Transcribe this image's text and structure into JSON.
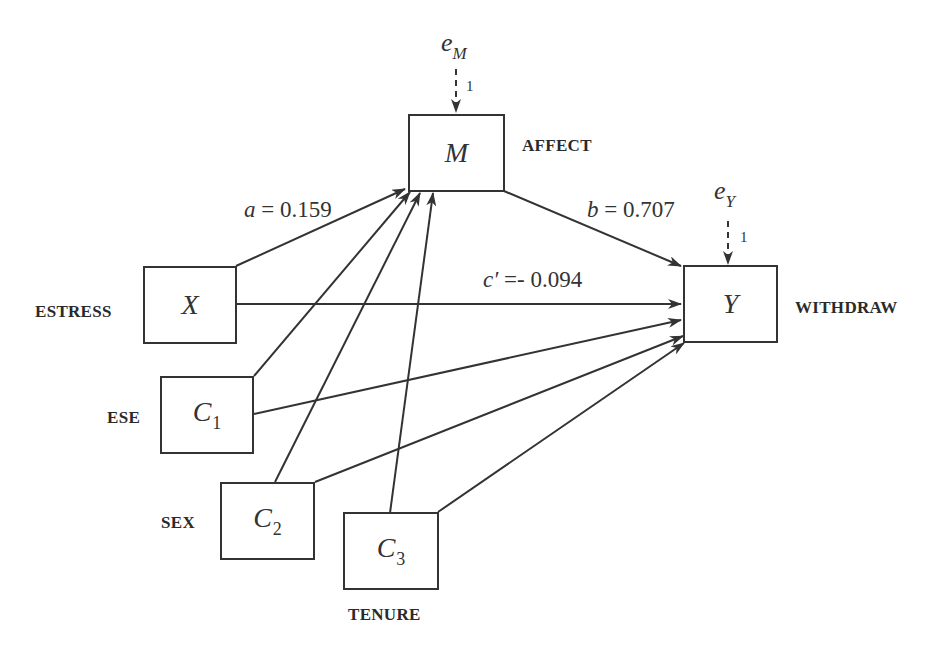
{
  "diagram": {
    "type": "mediation-path-diagram",
    "nodes": {
      "X": {
        "symbol": "X",
        "subscript": "",
        "name": "ESTRESS"
      },
      "M": {
        "symbol": "M",
        "subscript": "",
        "name": "AFFECT"
      },
      "Y": {
        "symbol": "Y",
        "subscript": "",
        "name": "WITHDRAW"
      },
      "C1": {
        "symbol": "C",
        "subscript": "1",
        "name": "ESE"
      },
      "C2": {
        "symbol": "C",
        "subscript": "2",
        "name": "SEX"
      },
      "C3": {
        "symbol": "C",
        "subscript": "3",
        "name": "TENURE"
      }
    },
    "errors": {
      "eM": {
        "symbol": "e",
        "subscript": "M",
        "weight": "1"
      },
      "eY": {
        "symbol": "e",
        "subscript": "Y",
        "weight": "1"
      }
    },
    "paths": {
      "a": {
        "label": "a",
        "equals": " = 0.159",
        "from": "X",
        "to": "M"
      },
      "b": {
        "label": "b",
        "equals": " = 0.707",
        "from": "M",
        "to": "Y"
      },
      "c_prime": {
        "label": "c′",
        "equals": " =- 0.094",
        "from": "X",
        "to": "Y"
      }
    },
    "unlabeled_paths": [
      {
        "from": "C1",
        "to": "M"
      },
      {
        "from": "C2",
        "to": "M"
      },
      {
        "from": "C3",
        "to": "M"
      },
      {
        "from": "C1",
        "to": "Y"
      },
      {
        "from": "C2",
        "to": "Y"
      },
      {
        "from": "C3",
        "to": "Y"
      },
      {
        "from": "eM",
        "to": "M",
        "style": "dashed"
      },
      {
        "from": "eY",
        "to": "Y",
        "style": "dashed"
      }
    ],
    "colors": {
      "stroke": "#333333",
      "text": "#2a2a2a",
      "background": "#ffffff"
    }
  }
}
